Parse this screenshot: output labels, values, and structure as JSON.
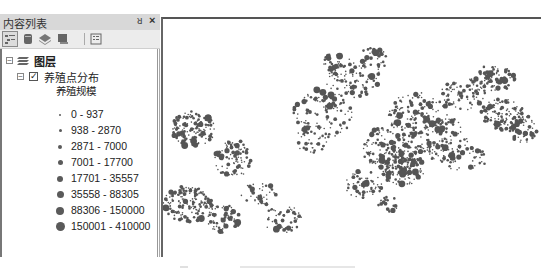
{
  "toc": {
    "title": "内容列表",
    "pin_glyph": "ꟻ",
    "close_glyph": "×",
    "toolbar": [
      {
        "name": "list-by-drawing-order",
        "active": true
      },
      {
        "name": "list-by-source",
        "active": false
      },
      {
        "name": "list-by-visibility",
        "active": false
      },
      {
        "name": "list-by-selection",
        "active": false
      },
      {
        "name": "options",
        "active": false
      }
    ],
    "tree": {
      "root": {
        "label": "图层",
        "expanded": true
      },
      "layer": {
        "label": "养殖点分布",
        "checked": true,
        "expanded": true
      },
      "field_heading": "养殖规模",
      "classes": [
        {
          "label": "0 - 937",
          "size": 2
        },
        {
          "label": "938 - 2870",
          "size": 3
        },
        {
          "label": "2871 - 7000",
          "size": 4
        },
        {
          "label": "7001 - 17700",
          "size": 5
        },
        {
          "label": "17701 - 35557",
          "size": 6
        },
        {
          "label": "35558 - 88305",
          "size": 7
        },
        {
          "label": "88306 - 150000",
          "size": 8
        },
        {
          "label": "150001 - 410000",
          "size": 9
        }
      ]
    }
  },
  "map": {
    "symbol_color": "#555555",
    "background": "#ffffff"
  },
  "colors": {
    "header_bg": "#d8d8d8",
    "toolbar_bg": "#ececec",
    "symbol": "#5a5a5a"
  }
}
